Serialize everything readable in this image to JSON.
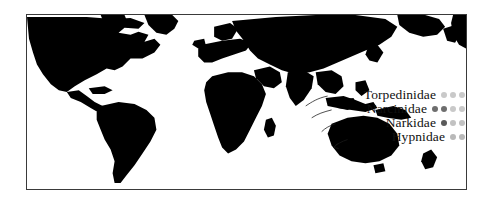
{
  "figure": {
    "type": "distribution-map",
    "projection": "world-equirectangular-pacific-centered",
    "land_color": "#000000",
    "ocean_color": "#ffffff",
    "frame_color": "#3a3a3a"
  },
  "legend": {
    "position": "center-right",
    "rows": [
      {
        "label": "Torpedinidae",
        "dots": [
          {
            "name": "dot-light",
            "color": "#c9c9c9"
          },
          {
            "name": "dot-light",
            "color": "#c9c9c9"
          },
          {
            "name": "dot-light",
            "color": "#c9c9c9"
          }
        ]
      },
      {
        "label": "Narcinidae",
        "dots": [
          {
            "name": "dot-dark",
            "color": "#6e6e6e"
          },
          {
            "name": "dot-dark",
            "color": "#6e6e6e"
          },
          {
            "name": "dot-light",
            "color": "#c9c9c9"
          },
          {
            "name": "dot-light",
            "color": "#c9c9c9"
          }
        ]
      },
      {
        "label": "Narkidae",
        "dots": [
          {
            "name": "dot-dark",
            "color": "#5a5a5a"
          },
          {
            "name": "dot-light",
            "color": "#c2c2c2"
          },
          {
            "name": "dot-light",
            "color": "#c2c2c2"
          }
        ]
      },
      {
        "label": "Hypnidae",
        "dots": [
          {
            "name": "dot-light",
            "color": "#b9b9b9"
          },
          {
            "name": "dot-light",
            "color": "#b9b9b9"
          }
        ]
      }
    ]
  }
}
